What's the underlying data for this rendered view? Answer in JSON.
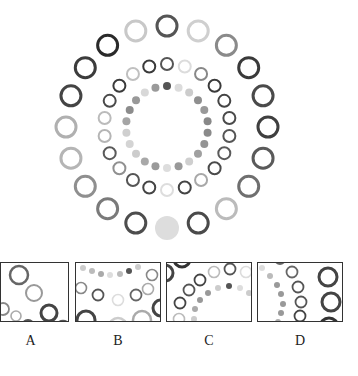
{
  "puzzle": {
    "description": "Concentric rings of circles with varying gray shades; choose the fragment that fits",
    "center": [
      167,
      127
    ],
    "rings": [
      {
        "name": "outer",
        "radius": 101,
        "element_radius": 10,
        "stroke_width": 3,
        "shades": [
          "#555555",
          "#cfcfcf",
          "#8a8a8a",
          "#3a3a3a",
          "#4a4a4a",
          "#3f3f3f",
          "#5a5a5a",
          "#6f6f6f",
          "#bbbbbb",
          "#4a4a4a",
          "FILLED:#dddddd",
          "#4d4d4d",
          "#7a7a7a",
          "#8f8f8f",
          "#b5b5b5",
          "#b0b0b0",
          "#444444",
          "#3c3c3c",
          "#2a2a2a",
          "#c8c8c8"
        ]
      },
      {
        "name": "middle",
        "radius": 63,
        "element_radius": 6,
        "stroke_width": 2,
        "shades": [
          "#555555",
          "#dcdcdc",
          "#888888",
          "#3a3a3a",
          "#444444",
          "#4a4a4a",
          "#555555",
          "#5a5a5a",
          "#4a4a4a",
          "#a8a8a8",
          "#444444",
          "#dddddd",
          "#444444",
          "#555555",
          "#909090",
          "#5a5a5a",
          "#b5b5b5",
          "#bbbbbb",
          "#4a4a4a",
          "#3a3a3a",
          "#c0c0c0",
          "#3a3a3a"
        ]
      },
      {
        "name": "inner",
        "radius": 41,
        "element_radius": 4,
        "filled": true,
        "shades": [
          "#555555",
          "#dcdcdc",
          "#cccccc",
          "#8f8f8f",
          "#999999",
          "#888888",
          "#8a8a8a",
          "#949494",
          "#a0a0a0",
          "#cfcfcf",
          "#999999",
          "#dddddd",
          "#9a9a9a",
          "#a8a8a8",
          "#cccccc",
          "#d4d4d4",
          "#cfcfcf",
          "#a5a5a5",
          "#8c8c8c",
          "#999999",
          "#d8d8d8",
          "#9a9a9a"
        ]
      }
    ]
  },
  "options": [
    {
      "label": "A",
      "x": 0,
      "width": 69
    },
    {
      "label": "B",
      "x": 75,
      "width": 86
    },
    {
      "label": "C",
      "x": 166,
      "width": 86
    },
    {
      "label": "D",
      "x": 257,
      "width": 86
    }
  ],
  "option_contents": {
    "A": [
      {
        "cx": 18,
        "cy": 12,
        "r": 9,
        "stroke": "#666",
        "sw": 2.5
      },
      {
        "cx": 33,
        "cy": 30,
        "r": 8,
        "stroke": "#999",
        "sw": 2
      },
      {
        "cx": 2,
        "cy": 46,
        "r": 6,
        "stroke": "#888",
        "sw": 1.8
      },
      {
        "cx": 15,
        "cy": 53,
        "r": 5,
        "stroke": "#aaa",
        "sw": 1.6
      },
      {
        "cx": 48,
        "cy": 50,
        "r": 8,
        "stroke": "#444",
        "sw": 3
      },
      {
        "cx": 27,
        "cy": 63,
        "r": 6,
        "stroke": "#555",
        "sw": 2
      },
      {
        "cx": 62,
        "cy": 65,
        "r": 7,
        "stroke": "#555",
        "sw": 2.5
      }
    ],
    "B": [
      {
        "cx": 7,
        "cy": 5,
        "r": 3,
        "fill": "#ccc"
      },
      {
        "cx": 16,
        "cy": 8,
        "r": 3,
        "fill": "#bbb"
      },
      {
        "cx": 25,
        "cy": 11,
        "r": 3,
        "fill": "#aaa"
      },
      {
        "cx": 34,
        "cy": 12,
        "r": 3,
        "fill": "#ddd"
      },
      {
        "cx": 44,
        "cy": 11,
        "r": 3,
        "fill": "#bbb"
      },
      {
        "cx": 53,
        "cy": 8,
        "r": 3,
        "fill": "#555"
      },
      {
        "cx": 62,
        "cy": 4,
        "r": 3,
        "fill": "#ccc"
      },
      {
        "cx": 76,
        "cy": 12,
        "r": 5.5,
        "stroke": "#888",
        "sw": 1.6
      },
      {
        "cx": 5,
        "cy": 25,
        "r": 5.5,
        "stroke": "#888",
        "sw": 1.6
      },
      {
        "cx": 22,
        "cy": 32,
        "r": 5.5,
        "stroke": "#555",
        "sw": 1.8
      },
      {
        "cx": 42,
        "cy": 37,
        "r": 5.5,
        "stroke": "#ddd",
        "sw": 1.6
      },
      {
        "cx": 60,
        "cy": 32,
        "r": 5.5,
        "stroke": "#666",
        "sw": 1.8
      },
      {
        "cx": 72,
        "cy": 26,
        "r": 5.5,
        "stroke": "#aaa",
        "sw": 1.6
      },
      {
        "cx": 85,
        "cy": 45,
        "r": 8,
        "stroke": "#444",
        "sw": 3
      },
      {
        "cx": 10,
        "cy": 57,
        "r": 9,
        "stroke": "#444",
        "sw": 3
      },
      {
        "cx": 42,
        "cy": 64,
        "r": 9,
        "stroke": "#ccc",
        "sw": 2.5
      },
      {
        "cx": 66,
        "cy": 57,
        "r": 9,
        "stroke": "#aaa",
        "sw": 2.5
      }
    ],
    "C": [
      {
        "cx": 15,
        "cy": -4,
        "r": 8,
        "stroke": "#333",
        "sw": 3
      },
      {
        "cx": -2,
        "cy": 10,
        "r": 8,
        "stroke": "#444",
        "sw": 3
      },
      {
        "cx": 47,
        "cy": 9,
        "r": 5.5,
        "stroke": "#bbb",
        "sw": 1.6
      },
      {
        "cx": 63,
        "cy": 6,
        "r": 5.5,
        "stroke": "#555",
        "sw": 1.8
      },
      {
        "cx": 79,
        "cy": 9,
        "r": 5.5,
        "stroke": "#ddd",
        "sw": 1.6
      },
      {
        "cx": 33,
        "cy": 17,
        "r": 5.5,
        "stroke": "#444",
        "sw": 1.8
      },
      {
        "cx": 22,
        "cy": 27,
        "r": 5.5,
        "stroke": "#555",
        "sw": 1.8
      },
      {
        "cx": 13,
        "cy": 40,
        "r": 5.5,
        "stroke": "#444",
        "sw": 1.8
      },
      {
        "cx": 12,
        "cy": 56,
        "r": 5.5,
        "stroke": "#bbb",
        "sw": 1.6
      },
      {
        "cx": 51,
        "cy": 25,
        "r": 3,
        "fill": "#ccc"
      },
      {
        "cx": 62,
        "cy": 23,
        "r": 3,
        "fill": "#555"
      },
      {
        "cx": 73,
        "cy": 25,
        "r": 3,
        "fill": "#ddd"
      },
      {
        "cx": 82,
        "cy": 30,
        "r": 3,
        "fill": "#ccc"
      },
      {
        "cx": 41,
        "cy": 30,
        "r": 3,
        "fill": "#999"
      },
      {
        "cx": 33,
        "cy": 37,
        "r": 3,
        "fill": "#999"
      },
      {
        "cx": 28,
        "cy": 46,
        "r": 3,
        "fill": "#aaa"
      },
      {
        "cx": 27,
        "cy": 56,
        "r": 3,
        "fill": "#ccc"
      }
    ],
    "D": [
      {
        "cx": 22,
        "cy": -4,
        "r": 5,
        "stroke": "#666",
        "sw": 1.8
      },
      {
        "cx": 4,
        "cy": 5,
        "r": 3,
        "fill": "#ddd"
      },
      {
        "cx": 12,
        "cy": 13,
        "r": 3,
        "fill": "#bbb"
      },
      {
        "cx": 19,
        "cy": 22,
        "r": 3,
        "fill": "#999"
      },
      {
        "cx": 23,
        "cy": 31,
        "r": 3,
        "fill": "#999"
      },
      {
        "cx": 25,
        "cy": 41,
        "r": 3,
        "fill": "#999"
      },
      {
        "cx": 23,
        "cy": 50,
        "r": 3,
        "fill": "#999"
      },
      {
        "cx": 20,
        "cy": 59,
        "r": 3,
        "fill": "#aaa"
      },
      {
        "cx": 34,
        "cy": 9,
        "r": 5.5,
        "stroke": "#666",
        "sw": 1.8
      },
      {
        "cx": 40,
        "cy": 24,
        "r": 5.5,
        "stroke": "#555",
        "sw": 1.8
      },
      {
        "cx": 43,
        "cy": 39,
        "r": 5.5,
        "stroke": "#555",
        "sw": 1.8
      },
      {
        "cx": 42,
        "cy": 53,
        "r": 5.5,
        "stroke": "#444",
        "sw": 1.8
      },
      {
        "cx": 70,
        "cy": 14,
        "r": 9,
        "stroke": "#444",
        "sw": 3
      },
      {
        "cx": 73,
        "cy": 39,
        "r": 9,
        "stroke": "#444",
        "sw": 3
      },
      {
        "cx": 71,
        "cy": 64,
        "r": 9,
        "stroke": "#333",
        "sw": 3
      }
    ]
  }
}
